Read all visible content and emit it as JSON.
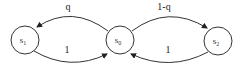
{
  "diagram": {
    "type": "state-transition",
    "nodes": [
      {
        "id": "s1",
        "label": "s",
        "subscript": "1",
        "cx": 25,
        "cy": 40,
        "r": 14
      },
      {
        "id": "s0",
        "label": "s",
        "subscript": "0",
        "cx": 120,
        "cy": 40,
        "r": 14
      },
      {
        "id": "s2",
        "label": "s",
        "subscript": "2",
        "cx": 218,
        "cy": 41,
        "r": 14
      }
    ],
    "edges": [
      {
        "from": "s0",
        "to": "s1",
        "label": "q"
      },
      {
        "from": "s1",
        "to": "s0",
        "label": "1"
      },
      {
        "from": "s0",
        "to": "s2",
        "label": "1-q"
      },
      {
        "from": "s2",
        "to": "s0",
        "label": "1"
      }
    ],
    "colors": {
      "stroke": "#333333",
      "background": "#ffffff"
    }
  }
}
